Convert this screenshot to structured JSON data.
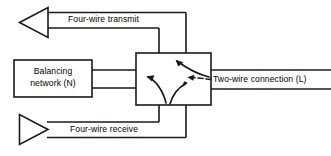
{
  "diagram": {
    "labels": {
      "four_wire_transmit": "Four-wire transmit",
      "four_wire_receive": "Four-wire receive",
      "two_wire_connection": "Two-wire connection (L)",
      "balancing_network_line1": "Balancing",
      "balancing_network_line2": "network (N)"
    },
    "colors": {
      "stroke": "#1a1a1a",
      "background": "#ffffff",
      "text": "#000000"
    },
    "nodes": [
      {
        "id": "balancing-network-box",
        "shape": "rectangle",
        "x": 14,
        "y": 60,
        "width": 78,
        "height": 37
      },
      {
        "id": "hybrid-box",
        "shape": "rectangle",
        "x": 136,
        "y": 53,
        "width": 75,
        "height": 52
      },
      {
        "id": "transmit-arrowhead",
        "shape": "triangle",
        "direction": "left"
      },
      {
        "id": "receive-arrowhead",
        "shape": "triangle",
        "direction": "right"
      }
    ],
    "internal_arrows": [
      {
        "id": "arrow-bottom-to-left",
        "from": "bottom",
        "to": "left"
      },
      {
        "id": "arrow-bottom-to-right",
        "from": "bottom",
        "to": "right"
      },
      {
        "id": "arrow-right-to-top",
        "from": "right",
        "to": "top"
      },
      {
        "id": "arrow-left-to-right",
        "from": "left",
        "to": "right"
      }
    ]
  }
}
